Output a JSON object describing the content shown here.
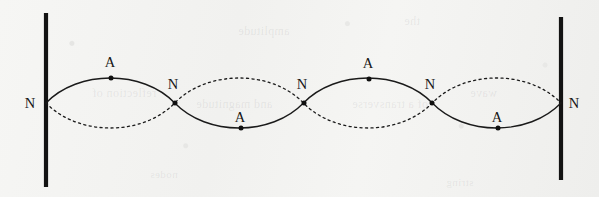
{
  "figure": {
    "width": 599,
    "height": 197,
    "background_color": "#f3f3f1",
    "ink_color": "#1a1a1a"
  },
  "walls": [
    {
      "id": "left-wall",
      "x": 46,
      "y_top": 13,
      "y_bottom": 187,
      "color": "#131313"
    },
    {
      "id": "right-wall",
      "x": 561,
      "y_top": 17,
      "y_bottom": 180,
      "color": "#131313"
    }
  ],
  "axis": {
    "y_center": 103,
    "x_start": 46,
    "x_end": 561,
    "loop_count": 4,
    "amplitude": 25
  },
  "curves": [
    {
      "name": "solid-waveform",
      "style": "solid",
      "phase": "up-first",
      "description": "instantaneous displacement of the standing wave"
    },
    {
      "name": "dashed-waveform",
      "style": "dashed",
      "phase": "down-first",
      "description": "displacement one half period later (mirror image)"
    }
  ],
  "nodes": [
    {
      "label": "N",
      "x": 46,
      "y": 103,
      "label_x": 30,
      "label_y": 103,
      "dot": false
    },
    {
      "label": "N",
      "x": 175,
      "y": 103,
      "label_x": 173,
      "label_y": 84,
      "dot": true
    },
    {
      "label": "N",
      "x": 304,
      "y": 103,
      "label_x": 302,
      "label_y": 84,
      "dot": true
    },
    {
      "label": "N",
      "x": 432,
      "y": 103,
      "label_x": 430,
      "label_y": 84,
      "dot": true
    },
    {
      "label": "N",
      "x": 561,
      "y": 103,
      "label_x": 574,
      "label_y": 103,
      "dot": false
    }
  ],
  "antinodes": [
    {
      "label": "A",
      "x": 111,
      "y": 78,
      "label_x": 110,
      "label_y": 62,
      "dot": true
    },
    {
      "label": "A",
      "x": 241,
      "y": 128,
      "label_x": 240,
      "label_y": 117,
      "dot": true
    },
    {
      "label": "A",
      "x": 369,
      "y": 79,
      "label_x": 368,
      "label_y": 63,
      "dot": true
    },
    {
      "label": "A",
      "x": 498,
      "y": 128,
      "label_x": 497,
      "label_y": 117,
      "dot": true
    }
  ],
  "ghost_marks": [
    {
      "text": "reflection of",
      "x": 92,
      "y": 86,
      "size": 12
    },
    {
      "text": "and  magnitude",
      "x": 196,
      "y": 97,
      "size": 12
    },
    {
      "text": "of a  transverse",
      "x": 352,
      "y": 97,
      "size": 12
    },
    {
      "text": "wave",
      "x": 470,
      "y": 86,
      "size": 12
    },
    {
      "text": "amplitude",
      "x": 238,
      "y": 24,
      "size": 12
    },
    {
      "text": "the",
      "x": 404,
      "y": 14,
      "size": 12
    },
    {
      "text": "nodes",
      "x": 150,
      "y": 168,
      "size": 11
    },
    {
      "text": "string",
      "x": 446,
      "y": 176,
      "size": 11
    }
  ],
  "chart_data": {
    "type": "line",
    "xlabel": "",
    "ylabel": "",
    "xlim": [
      46,
      561
    ],
    "ylim": [
      78,
      128
    ],
    "grid": false,
    "legend": "none",
    "categories": [
      "N",
      "A",
      "N",
      "A",
      "N",
      "A",
      "N",
      "A",
      "N"
    ],
    "x": [
      46,
      111,
      175,
      241,
      304,
      369,
      432,
      498,
      561
    ],
    "series": [
      {
        "name": "solid-waveform",
        "values": [
          103,
          78,
          103,
          128,
          103,
          79,
          103,
          128,
          103
        ]
      },
      {
        "name": "dashed-waveform",
        "values": [
          103,
          128,
          103,
          78,
          103,
          127,
          103,
          78,
          103
        ]
      }
    ],
    "annotations": [
      {
        "text": "N",
        "x": 46,
        "y": 103
      },
      {
        "text": "A",
        "x": 111,
        "y": 78
      },
      {
        "text": "N",
        "x": 175,
        "y": 103
      },
      {
        "text": "A",
        "x": 241,
        "y": 128
      },
      {
        "text": "N",
        "x": 304,
        "y": 103
      },
      {
        "text": "A",
        "x": 369,
        "y": 79
      },
      {
        "text": "N",
        "x": 432,
        "y": 103
      },
      {
        "text": "A",
        "x": 498,
        "y": 128
      },
      {
        "text": "N",
        "x": 561,
        "y": 103
      }
    ]
  }
}
